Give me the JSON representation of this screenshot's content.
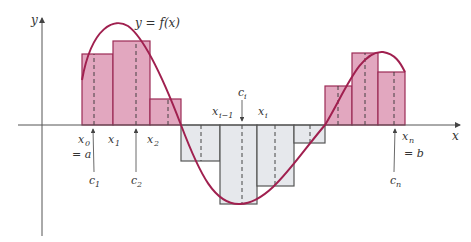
{
  "figure": {
    "curve_label": "y = f(x)",
    "axis_x_label": "x",
    "axis_y_label": "y",
    "colors": {
      "positive_fill": "#e2a7bf",
      "negative_fill": "#e6e8ec",
      "rect_stroke_pos": "#9c2a55",
      "rect_stroke_neg": "#555555",
      "curve": "#a0204f",
      "axis": "#555555"
    },
    "partition_labels": {
      "x0": "x",
      "x0_sub": "0",
      "a_label": "= a",
      "x1": "x",
      "x1_sub": "1",
      "x2": "x",
      "x2_sub": "2",
      "xim1": "x",
      "xim1_sub": "i−1",
      "xi": "x",
      "xi_sub": "i",
      "xn": "x",
      "xn_sub": "n",
      "b_label": "= b"
    },
    "sample_labels": {
      "c1": "c",
      "c1_sub": "1",
      "c2": "c",
      "c2_sub": "2",
      "ci": "c",
      "ci_sub": "i",
      "cn": "c",
      "cn_sub": "n"
    },
    "rectangles": [
      {
        "name": "rect-1",
        "sign": "positive",
        "height": 0.71
      },
      {
        "name": "rect-2",
        "sign": "positive",
        "height": 0.84
      },
      {
        "name": "rect-3",
        "sign": "positive",
        "height": 0.26
      },
      {
        "name": "rect-4",
        "sign": "negative",
        "height": -0.36
      },
      {
        "name": "rect-5",
        "sign": "negative",
        "height": -0.79
      },
      {
        "name": "rect-6",
        "sign": "negative",
        "height": -0.61
      },
      {
        "name": "rect-7",
        "sign": "negative",
        "height": -0.18
      },
      {
        "name": "rect-8",
        "sign": "positive",
        "height": 0.39
      },
      {
        "name": "rect-9",
        "sign": "positive",
        "height": 0.72
      },
      {
        "name": "rect-10",
        "sign": "positive",
        "height": 0.53
      }
    ]
  }
}
